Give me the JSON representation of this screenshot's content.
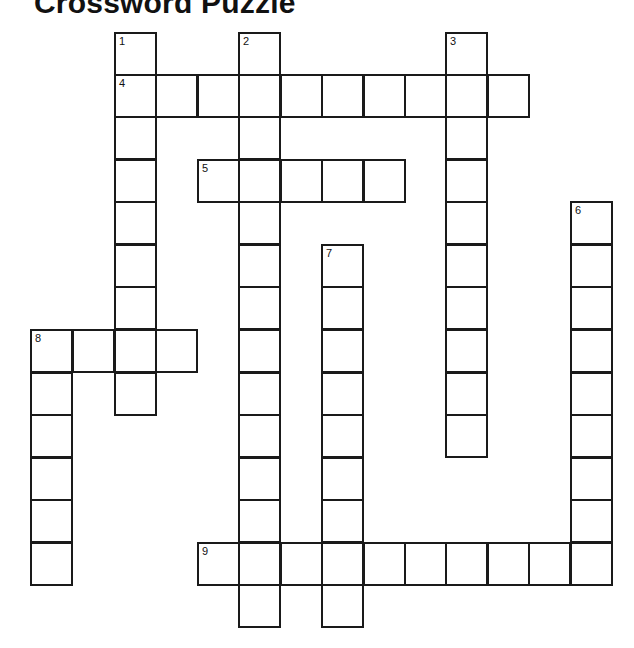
{
  "title": "Crossword Puzzle",
  "grid": {
    "cell_size": 41.5,
    "col_x": [
      31,
      73,
      115,
      156,
      198,
      239,
      281,
      322,
      364,
      405,
      446,
      488,
      529,
      571
    ],
    "row_y": [
      33,
      75,
      117,
      160,
      202,
      245,
      287,
      330,
      373,
      415,
      458,
      500,
      543,
      585
    ]
  },
  "entries": [
    {
      "number": "1",
      "direction": "down",
      "row": 0,
      "col": 2,
      "length": 9
    },
    {
      "number": "2",
      "direction": "down",
      "row": 0,
      "col": 5,
      "length": 14
    },
    {
      "number": "3",
      "direction": "down",
      "row": 0,
      "col": 10,
      "length": 10
    },
    {
      "number": "4",
      "direction": "across",
      "row": 1,
      "col": 2,
      "length": 10
    },
    {
      "number": "5",
      "direction": "across",
      "row": 3,
      "col": 4,
      "length": 5
    },
    {
      "number": "6",
      "direction": "down",
      "row": 4,
      "col": 13,
      "length": 9
    },
    {
      "number": "7",
      "direction": "down",
      "row": 5,
      "col": 7,
      "length": 9
    },
    {
      "number": "8",
      "direction": "across",
      "row": 7,
      "col": 0,
      "length": 4
    },
    {
      "number": "8",
      "direction": "down",
      "row": 7,
      "col": 0,
      "length": 6
    },
    {
      "number": "9",
      "direction": "across",
      "row": 12,
      "col": 4,
      "length": 10
    }
  ]
}
